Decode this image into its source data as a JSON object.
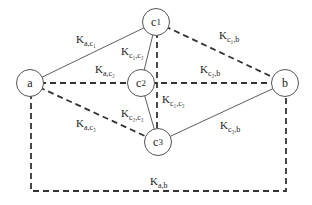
{
  "nodes": [
    {
      "id": "a",
      "label": "a",
      "x": 30,
      "y": 83
    },
    {
      "id": "c1",
      "label": "c",
      "sub": "1",
      "x": 156,
      "y": 22
    },
    {
      "id": "c2",
      "label": "c",
      "sub": "2",
      "x": 141,
      "y": 83
    },
    {
      "id": "c3",
      "label": "c",
      "sub": "3",
      "x": 158,
      "y": 142
    },
    {
      "id": "b",
      "label": "b",
      "x": 285,
      "y": 83
    }
  ],
  "edges": [
    {
      "from": "a",
      "to": "c1",
      "style": "solid",
      "label": "K",
      "sub": "a,c1"
    },
    {
      "from": "a",
      "to": "c2",
      "style": "dashed",
      "label": "K",
      "sub": "a,c2"
    },
    {
      "from": "a",
      "to": "c3",
      "style": "dashed",
      "label": "K",
      "sub": "a,c3"
    },
    {
      "from": "c1",
      "to": "c2",
      "style": "solid",
      "label": "K",
      "sub": "c1,c2"
    },
    {
      "from": "c1",
      "to": "c3",
      "style": "dashed",
      "label": "K",
      "sub": "c1,c3"
    },
    {
      "from": "c2",
      "to": "c3",
      "style": "solid",
      "label": "K",
      "sub": "c2,c3"
    },
    {
      "from": "c1",
      "to": "b",
      "style": "dashed",
      "label": "K",
      "sub": "c1,b"
    },
    {
      "from": "c2",
      "to": "b",
      "style": "dashed",
      "label": "K",
      "sub": "c2,b"
    },
    {
      "from": "c3",
      "to": "b",
      "style": "solid",
      "label": "K",
      "sub": "c3,b"
    },
    {
      "from": "a",
      "to": "b",
      "style": "dashed",
      "label": "K",
      "sub": "a,b",
      "route": "rectangle-below"
    }
  ],
  "labels": {
    "a_c1": "K",
    "a_c1_sub": "a,c₁",
    "a_c2": "K",
    "a_c2_sub": "a,c₂",
    "a_c3": "K",
    "a_c3_sub": "a,c₃",
    "c1_c2": "K",
    "c1_c2_sub": "c₁,c₂",
    "c1_c3": "K",
    "c1_c3_sub": "c₁,c₃",
    "c2_c3": "K",
    "c2_c3_sub": "c₂,c₃",
    "c1_b": "K",
    "c1_b_sub": "c₁,b",
    "c2_b": "K",
    "c2_b_sub": "c₂,b",
    "c3_b": "K",
    "c3_b_sub": "c₃,b",
    "a_b": "K",
    "a_b_sub": "a,b"
  },
  "node_labels": {
    "a": "a",
    "c1": "c",
    "c1_sub": "1",
    "c2": "c",
    "c2_sub": "2",
    "c3": "c",
    "c3_sub": "3",
    "b": "b"
  }
}
